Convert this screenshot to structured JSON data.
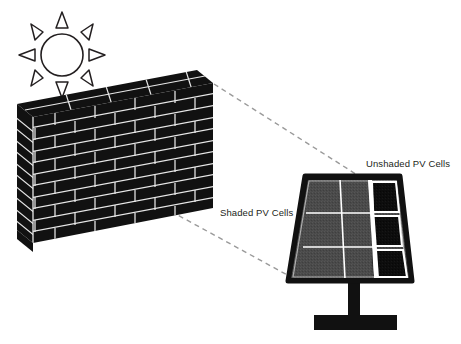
{
  "figure": {
    "background_color": "#ffffff"
  },
  "labels": {
    "unshaded": "Unshaded PV Cells",
    "shaded": "Shaded PV Cells",
    "text_color": "#231f20",
    "font_size_px": 9.5
  },
  "sun": {
    "name": "sun",
    "center_x": 62,
    "center_y": 55,
    "radius": 21,
    "ray_count": 8,
    "stroke_color": "#231f20",
    "fill_color": "#ffffff"
  },
  "wall": {
    "name": "brick-wall",
    "brick_color": "#111111",
    "mortar_color": "#e8e8e8",
    "front_face": {
      "top_left_x": 33,
      "top_left_y": 117,
      "top_right_x": 213,
      "top_right_y": 83,
      "bottom_right_x": 213,
      "bottom_right_y": 208,
      "bottom_left_x": 33,
      "bottom_left_y": 243
    },
    "courses": 11,
    "columns": 9
  },
  "panel": {
    "name": "solar-panel",
    "frame_color": "#111111",
    "shaded_cell_color": "#4a4a4a",
    "unshaded_cell_color": "#0d0d0d",
    "grid_line_color": "#ffffff",
    "rows": 3,
    "columns": 3,
    "shaded_columns": 2,
    "unshaded_columns": 1,
    "top_left_x": 305,
    "top_right_x": 400,
    "top_y": 176,
    "bottom_left_x": 288,
    "bottom_right_x": 412,
    "bottom_y": 281
  },
  "stand": {
    "name": "panel-stand",
    "color": "#111111",
    "pole_x": 348,
    "pole_y": 281,
    "pole_width": 12,
    "pole_height": 37,
    "base_x": 314,
    "base_y": 315,
    "base_width": 83,
    "base_height": 15
  },
  "leader_lines": {
    "color": "#9a9a9a",
    "dash": "5,4",
    "upper": {
      "name": "leader-line-unshaded",
      "from_x": 214,
      "from_y": 84,
      "to_x": 362,
      "to_y": 178
    },
    "lower": {
      "name": "leader-line-shaded",
      "from_x": 163,
      "from_y": 207,
      "to_x": 291,
      "to_y": 277
    }
  }
}
